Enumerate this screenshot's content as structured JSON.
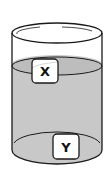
{
  "diagram": {
    "container": "cylindrical beaker",
    "liquid_color": "#c8c8c8",
    "outline_color": "#1a1a1a",
    "objects": [
      {
        "id": "X",
        "label": "X",
        "position": "floating at liquid surface"
      },
      {
        "id": "Y",
        "label": "Y",
        "position": "resting at bottom"
      }
    ]
  }
}
